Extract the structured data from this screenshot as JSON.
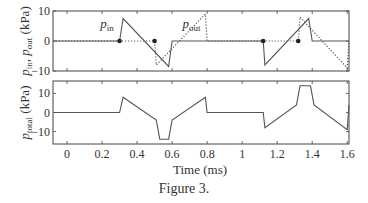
{
  "figure": {
    "caption": "Figure 3.",
    "xlabel": "Time (ms)"
  },
  "chart_data": [
    {
      "type": "line",
      "title": "",
      "xlabel": "",
      "ylabel": "p_in, p_out (kPa)",
      "ylabel_parts": {
        "p1": "p",
        "s1": "in",
        "sep": ", ",
        "p2": "p",
        "s2": "out",
        "unit": " (kPa)"
      },
      "xlim": [
        -0.08,
        1.61
      ],
      "ylim": [
        -10,
        10
      ],
      "yticks": [
        -10,
        0,
        10
      ],
      "ytick_labels": [
        "−10",
        "0",
        "10"
      ],
      "xticks": [
        0,
        0.2,
        0.4,
        0.6,
        0.8,
        1.0,
        1.2,
        1.4,
        1.6
      ],
      "grid": false,
      "series": [
        {
          "name": "p_in",
          "label": "p",
          "label_sub": "in",
          "style": "solid",
          "x": [
            -0.08,
            0.3,
            0.32,
            0.58,
            0.6,
            1.12,
            1.13,
            1.38,
            1.4,
            1.61
          ],
          "y": [
            0,
            0,
            7.5,
            -8.5,
            0,
            0,
            -8,
            7.5,
            0,
            0
          ]
        },
        {
          "name": "p_out",
          "label": "p",
          "label_sub": "out",
          "style": "dotted",
          "x": [
            -0.08,
            0.5,
            0.51,
            0.79,
            0.8,
            1.32,
            1.33,
            1.6,
            1.61
          ],
          "y": [
            0,
            0,
            -8,
            9,
            0,
            0,
            8,
            -9,
            0
          ]
        }
      ],
      "markers": [
        {
          "x": 0.3,
          "y": 0
        },
        {
          "x": 0.5,
          "y": 0
        },
        {
          "x": 1.12,
          "y": 0
        },
        {
          "x": 1.32,
          "y": 0
        }
      ],
      "annotations": [
        {
          "text": "p_in",
          "x": 0.19,
          "y": 4.5
        },
        {
          "text": "p_out",
          "x": 0.66,
          "y": 4.5
        }
      ]
    },
    {
      "type": "line",
      "title": "",
      "xlabel": "Time (ms)",
      "ylabel": "p_total (kPa)",
      "ylabel_parts": {
        "p1": "p",
        "s1": "total",
        "unit": " (kPa)"
      },
      "xlim": [
        -0.08,
        1.61
      ],
      "ylim": [
        -16.5,
        16.5
      ],
      "yticks": [
        -10,
        0,
        10
      ],
      "ytick_labels": [
        "−10",
        "0",
        "10"
      ],
      "xticks": [
        0,
        0.2,
        0.4,
        0.6,
        0.8,
        1.0,
        1.2,
        1.4,
        1.6
      ],
      "xtick_labels": [
        "0",
        "0.2",
        "0.4",
        "0.6",
        "0.8",
        "1",
        "1.2",
        "1.4",
        "1.6"
      ],
      "grid": false,
      "series": [
        {
          "name": "p_total",
          "style": "solid",
          "x": [
            -0.08,
            0.3,
            0.32,
            0.51,
            0.53,
            0.58,
            0.6,
            0.79,
            0.8,
            1.12,
            1.13,
            1.31,
            1.33,
            1.39,
            1.41,
            1.6,
            1.61
          ],
          "y": [
            0,
            0,
            8,
            -4,
            -14,
            -14,
            -4,
            8,
            0,
            0,
            -8,
            4,
            14,
            14,
            4,
            -9,
            4
          ]
        }
      ]
    }
  ]
}
